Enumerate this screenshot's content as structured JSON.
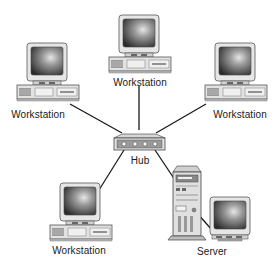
{
  "diagram": {
    "type": "star-network-topology",
    "nodes": [
      {
        "id": "ws-top",
        "kind": "workstation",
        "label": "Workstation"
      },
      {
        "id": "ws-left",
        "kind": "workstation",
        "label": "Workstation"
      },
      {
        "id": "ws-right",
        "kind": "workstation",
        "label": "Workstation"
      },
      {
        "id": "ws-bottom",
        "kind": "workstation",
        "label": "Workstation"
      },
      {
        "id": "hub",
        "kind": "hub",
        "label": "Hub"
      },
      {
        "id": "server",
        "kind": "server",
        "label": "Server"
      }
    ],
    "edges": [
      {
        "from": "hub",
        "to": "ws-top"
      },
      {
        "from": "hub",
        "to": "ws-left"
      },
      {
        "from": "hub",
        "to": "ws-right"
      },
      {
        "from": "hub",
        "to": "ws-bottom"
      },
      {
        "from": "hub",
        "to": "server"
      },
      {
        "from": "server",
        "to": "server-monitor"
      }
    ],
    "colors": {
      "line": "#1a1a1a",
      "device_body": "#e4e4e4",
      "device_outline": "#555555",
      "screen_dark": "#2a2a2a",
      "screen_light": "#d8d8d8"
    }
  }
}
